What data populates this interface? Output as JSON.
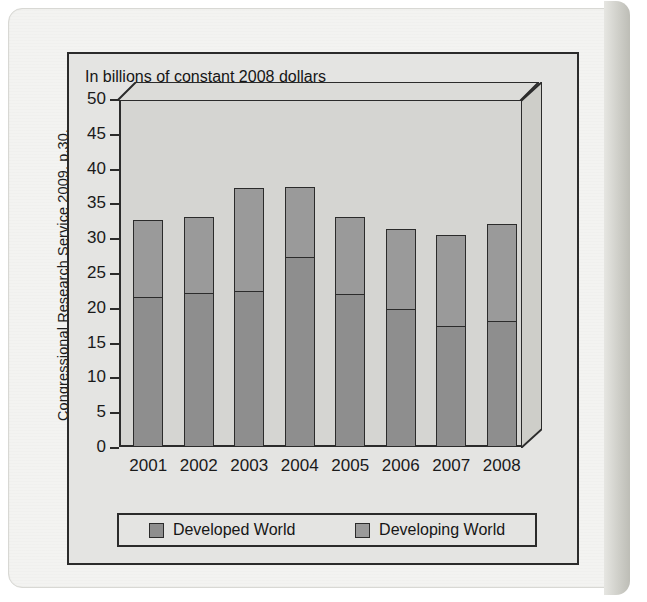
{
  "source_caption": "Congressional Research Service 2009, p.30.",
  "chart_data": {
    "type": "bar",
    "subtype": "stacked-vertical",
    "title": "In billions of constant 2008 dollars",
    "xlabel": "",
    "ylabel": "",
    "ylim": [
      0,
      50
    ],
    "ytick_step": 5,
    "yticks": [
      0,
      5,
      10,
      15,
      20,
      25,
      30,
      35,
      40,
      45,
      50
    ],
    "grid": false,
    "legend_position": "bottom",
    "categories": [
      "2001",
      "2002",
      "2003",
      "2004",
      "2005",
      "2006",
      "2007",
      "2008"
    ],
    "series": [
      {
        "name": "Developed World",
        "color": "#8e8e8e",
        "values": [
          21.4,
          22.0,
          22.3,
          27.2,
          21.8,
          19.7,
          17.2,
          18.0
        ]
      },
      {
        "name": "Developing World",
        "color": "#9a9a9a",
        "values": [
          11.2,
          11.1,
          14.9,
          10.1,
          11.2,
          11.6,
          13.2,
          14.0
        ]
      }
    ],
    "totals": [
      32.6,
      33.1,
      37.2,
      37.3,
      33.0,
      31.3,
      30.4,
      32.0
    ]
  },
  "legend": {
    "items": [
      {
        "label": "Developed World",
        "swatch": "swatch-developed"
      },
      {
        "label": "Developing World",
        "swatch": "swatch-developing"
      }
    ]
  }
}
